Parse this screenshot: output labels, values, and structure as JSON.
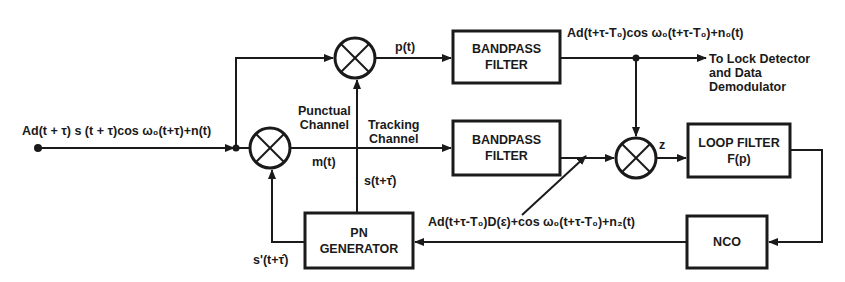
{
  "diagram": {
    "input_signal": "Ad(t + τ) s (t + τ)cos ω₀(t+τ)+n(t)",
    "blocks": {
      "bandpass_filter_1": {
        "line1": "BANDPASS",
        "line2": "FILTER"
      },
      "bandpass_filter_2": {
        "line1": "BANDPASS",
        "line2": "FILTER"
      },
      "loop_filter": {
        "line1": "LOOP FILTER",
        "line2": "F(p)"
      },
      "nco": {
        "line1": "NCO"
      },
      "pn_generator": {
        "line1": "PN",
        "line2": "GENERATOR"
      }
    },
    "signals": {
      "p_t": "p(t)",
      "m_t": "m(t)",
      "z": "z",
      "s_hat": "s(t+τ̂)",
      "s_prime_hat": "s'(t+τ̂)",
      "bpf1_output": "Ad(t+τ-T₀)cos ω₀(t+τ-T₀)+n₀(t)",
      "bpf2_output": "Ad(t+τ-T₀)D(ε)+cos ω₀(t+τ-T₀)+n₂(t)"
    },
    "channel_labels": {
      "punctual": {
        "line1": "Punctual",
        "line2": "Channel"
      },
      "tracking": {
        "line1": "Tracking",
        "line2": "Channel"
      }
    },
    "output_destination": {
      "line1": "To Lock Detector",
      "line2": "and Data",
      "line3": "Demodulator"
    }
  }
}
